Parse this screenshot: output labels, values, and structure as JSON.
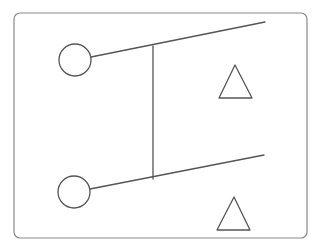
{
  "diagram": {
    "type": "line-drawing",
    "colors": {
      "stroke": "#555555",
      "frame": "#8a8a8a",
      "background": "#ffffff"
    },
    "frame": {
      "x": 14,
      "y": 13,
      "width": 293,
      "height": 225,
      "rx": 6
    },
    "circles": [
      {
        "name": "top-circle",
        "cx": 75,
        "cy": 60,
        "r": 16
      },
      {
        "name": "bottom-circle",
        "cx": 74,
        "cy": 192,
        "r": 16
      }
    ],
    "lines": [
      {
        "name": "top-branch-line",
        "x1": 91,
        "y1": 57,
        "x2": 265,
        "y2": 22
      },
      {
        "name": "bottom-branch-line",
        "x1": 90,
        "y1": 189,
        "x2": 264,
        "y2": 155
      },
      {
        "name": "vertical-connector",
        "x1": 153,
        "y1": 46,
        "x2": 153,
        "y2": 179
      }
    ],
    "triangles": [
      {
        "name": "top-triangle",
        "points": "235,65 219,98 252,98"
      },
      {
        "name": "bottom-triangle",
        "points": "234,197 217,230 250,230"
      }
    ]
  }
}
